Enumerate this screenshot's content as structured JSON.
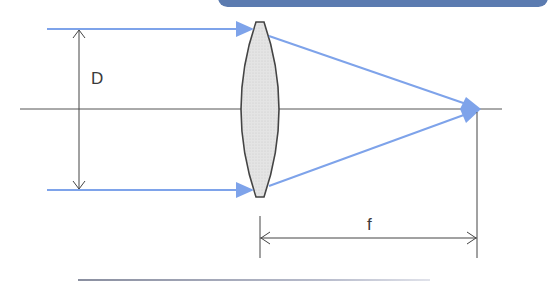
{
  "diagram": {
    "labels": {
      "diameter": "D",
      "focal_length": "f"
    },
    "colors": {
      "ray": "#7ea3ea",
      "lens_fill": "#e2e2e2",
      "lens_stroke": "#444444",
      "axis": "#555555",
      "banner": "#5b7bb0"
    },
    "elements": [
      "optical-axis",
      "convex-lens",
      "incoming-ray-top",
      "incoming-ray-bottom",
      "refracted-ray-top",
      "refracted-ray-bottom",
      "focal-point",
      "diameter-dimension",
      "focal-length-dimension"
    ]
  }
}
